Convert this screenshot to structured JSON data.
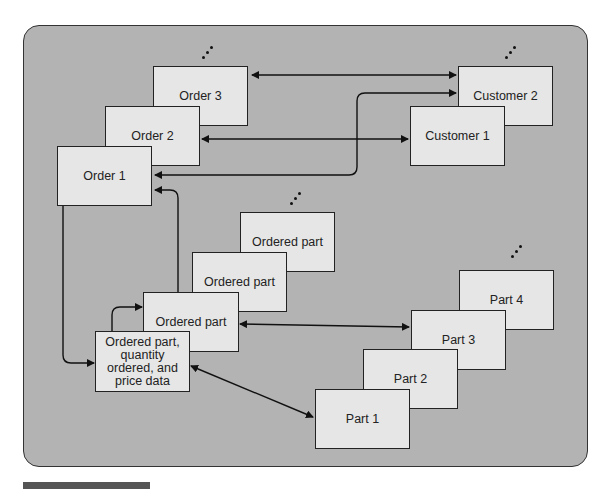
{
  "diagram": {
    "orders": [
      {
        "label": "Order 3"
      },
      {
        "label": "Order 2"
      },
      {
        "label": "Order 1"
      }
    ],
    "customers": [
      {
        "label": "Customer 2"
      },
      {
        "label": "Customer 1"
      }
    ],
    "ordered_parts": [
      {
        "label": "Ordered part"
      },
      {
        "label": "Ordered part"
      },
      {
        "label": "Ordered part"
      }
    ],
    "ordered_part_detail": {
      "label": "Ordered part, quantity ordered, and price data"
    },
    "parts": [
      {
        "label": "Part 4"
      },
      {
        "label": "Part 3"
      },
      {
        "label": "Part 2"
      },
      {
        "label": "Part 1"
      }
    ],
    "ellipsis_icon": "vertical-ellipsis-diagonal",
    "colors": {
      "panel": "#b3b3b3",
      "box": "#e6e6e6",
      "stroke": "#222222",
      "footer_bar": "#555555"
    }
  }
}
